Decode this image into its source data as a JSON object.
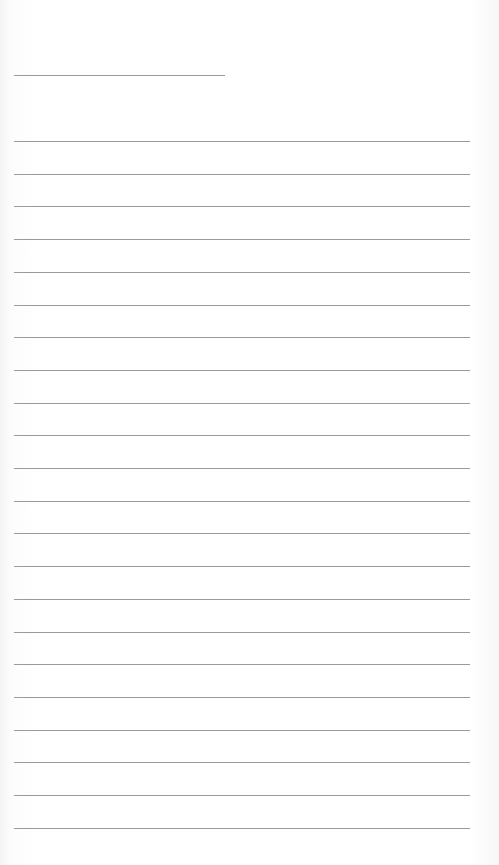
{
  "page": {
    "type": "lined-paper",
    "line_color": "#9a9a9a",
    "background": "#ffffff",
    "header_line": {
      "y": 75,
      "x": 14,
      "width": 211
    },
    "ruled_lines": {
      "count": 22,
      "start_y": 141,
      "spacing": 32.7,
      "x": 14,
      "width": 456
    }
  }
}
